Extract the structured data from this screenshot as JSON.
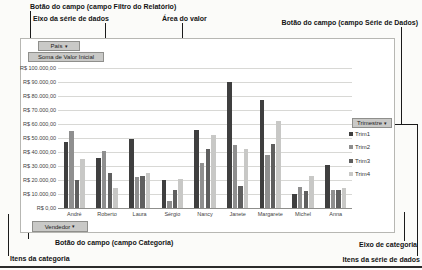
{
  "figure": {
    "annotations": {
      "filter_field_button": "Botão do campo (campo Filtro do Relatório)",
      "series_axis": "Eixo da série de dados",
      "value_area": "Área do valor",
      "series_field_button": "Botão do campo (campo Série de Dados)",
      "category_field_button": "Botão do campo (campo Categoria)",
      "category_items": "Itens da categoria",
      "category_axis": "Eixo de categoria",
      "series_items": "Itens da série de dados"
    },
    "field_buttons": {
      "report_filter": "País",
      "values": "Soma de Valor Inicial",
      "category": "Vendedor",
      "series": "Trimestre"
    },
    "icons": {
      "dropdown": "▾"
    }
  },
  "chart_data": {
    "type": "bar",
    "title": "",
    "xlabel": "",
    "ylabel": "",
    "categories": [
      "André",
      "Roberto",
      "Laura",
      "Sérgio",
      "Nancy",
      "Janete",
      "Margarete",
      "Michel",
      "Anna"
    ],
    "series": [
      {
        "name": "Trim1",
        "color": "#3f3f3f",
        "values": [
          47000,
          36000,
          49000,
          20000,
          56000,
          90000,
          77000,
          10000,
          31000
        ]
      },
      {
        "name": "Trim2",
        "color": "#8f8f8f",
        "values": [
          55000,
          41000,
          22000,
          5000,
          32000,
          45000,
          38000,
          15000,
          13000
        ]
      },
      {
        "name": "Trim3",
        "color": "#5f5f5f",
        "values": [
          20000,
          25000,
          23000,
          13000,
          42000,
          16000,
          46000,
          12000,
          13000
        ]
      },
      {
        "name": "Trim4",
        "color": "#c8c8c6",
        "values": [
          35000,
          14000,
          25000,
          21000,
          52000,
          42000,
          62000,
          23000,
          14000
        ]
      }
    ],
    "ylim": [
      0,
      100000
    ],
    "ytick_step": 10000,
    "ytick_labels": [
      "R$ 100.000,00",
      "R$ 90.000,00",
      "R$ 80.000,00",
      "R$ 70.000,00",
      "R$ 60.000,00",
      "R$ 50.000,00",
      "R$ 40.000,00",
      "R$ 30.000,00",
      "R$ 20.000,00",
      "R$ 10.000,00",
      "R$ 0,00"
    ],
    "grid": true,
    "legend_position": "right"
  }
}
